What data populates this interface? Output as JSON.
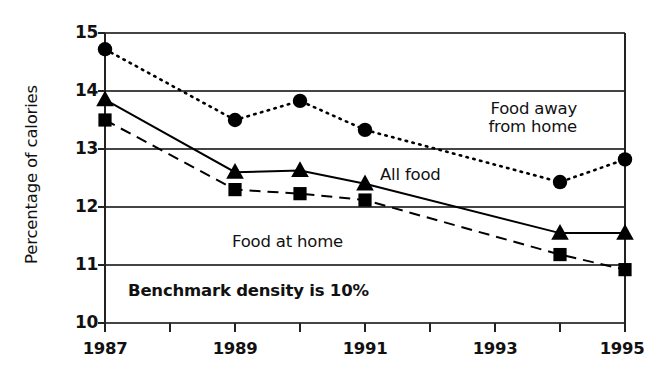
{
  "chart_data": {
    "type": "line",
    "title": "",
    "xlabel": "",
    "ylabel": "Percentage of calories",
    "x": [
      1987,
      1989,
      1990,
      1991,
      1994,
      1995
    ],
    "xlim": [
      1987,
      1995
    ],
    "ylim": [
      10,
      15
    ],
    "grid": true,
    "legend_position": "inline-annotations",
    "xticks": [
      1987,
      1988,
      1989,
      1990,
      1991,
      1992,
      1993,
      1994,
      1995
    ],
    "xtick_labels": [
      "1987",
      "",
      "1989",
      "",
      "1991",
      "",
      "1993",
      "",
      "1995"
    ],
    "yticks": [
      10,
      11,
      12,
      13,
      14,
      15
    ],
    "ytick_labels": [
      "10",
      "11",
      "12",
      "13",
      "14",
      "15"
    ],
    "series": [
      {
        "name": "Food away from home",
        "marker": "circle",
        "linestyle": "dotted",
        "values": [
          14.72,
          13.5,
          13.83,
          13.33,
          12.43,
          12.82
        ]
      },
      {
        "name": "All food",
        "marker": "triangle",
        "linestyle": "solid",
        "values": [
          13.85,
          12.6,
          12.63,
          12.4,
          11.55,
          11.55
        ]
      },
      {
        "name": "Food at home",
        "marker": "square",
        "linestyle": "dashed",
        "values": [
          13.5,
          12.3,
          12.23,
          12.12,
          11.18,
          10.92
        ]
      }
    ],
    "annotations": [
      {
        "text_line1": "Food away",
        "text_line2": "from home",
        "x": 1992.4,
        "y": 13.75
      },
      {
        "text_line1": "All food",
        "text_line2": "",
        "x": 1990.6,
        "y": 12.62
      },
      {
        "text_line1": "Food at home",
        "text_line2": "",
        "x": 1989.3,
        "y": 11.72
      },
      {
        "text_line1": "Benchmark density is 10%",
        "text_line2": "",
        "x": 1987.3,
        "y": 10.62
      }
    ]
  },
  "labels": {
    "ylabel": "Percentage of calories",
    "ytick_15": "15",
    "ytick_14": "14",
    "ytick_13": "13",
    "ytick_12": "12",
    "ytick_11": "11",
    "ytick_10": "10",
    "xtick_1987": "1987",
    "xtick_1989": "1989",
    "xtick_1991": "1991",
    "xtick_1993": "1993",
    "xtick_1995": "1995",
    "annot_food_away_1": "Food away",
    "annot_food_away_2": "from home",
    "annot_all_food": "All food",
    "annot_food_at_home": "Food at home",
    "annot_benchmark": "Benchmark density is 10%"
  },
  "colors": {
    "line": "#000000",
    "grid": "#444444",
    "axis": "#222222",
    "text": "#111111",
    "background": "#ffffff"
  }
}
